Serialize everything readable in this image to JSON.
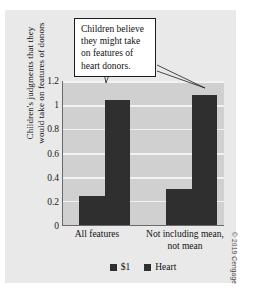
{
  "chart_data": {
    "type": "bar",
    "title": "",
    "xlabel": "",
    "ylabel_line1": "Children's judgments that they",
    "ylabel_line2": "would take on features of donors",
    "categories": [
      "All features",
      "Not including mean,\nnot mean"
    ],
    "category_labels": [
      {
        "line1": "All features",
        "line2": ""
      },
      {
        "line1": "Not including mean,",
        "line2": "not mean"
      }
    ],
    "series": [
      {
        "name": "$1",
        "color": "#2f2f2f",
        "values": [
          0.24,
          0.3
        ]
      },
      {
        "name": "Heart",
        "color": "#2f2f2f",
        "values": [
          1.04,
          1.08
        ]
      }
    ],
    "ylim": [
      0,
      1.2
    ],
    "yticks": [
      0,
      0.2,
      0.4,
      0.6,
      0.8,
      1,
      1.2
    ],
    "ytick_labels": [
      "0",
      "0.2",
      "0.4",
      "0.6",
      "0.8",
      "1",
      "1.2"
    ],
    "grid": true,
    "legend_position": "bottom-center",
    "plot_background": "#d0d0d0",
    "figure_background": "#e9e9e9",
    "gridline_color": "#f2f2f2",
    "axis_color": "#6a6a6a"
  },
  "annotation": {
    "text": "Children believe they might take on features of heart donors.",
    "lines": [
      "Children believe",
      "they might take",
      "on features of",
      "heart donors."
    ]
  },
  "legend": {
    "items": [
      {
        "label": "$1",
        "color": "#2f2f2f"
      },
      {
        "label": "Heart",
        "color": "#2f2f2f"
      }
    ]
  },
  "credit": "© 2019 Cengage"
}
